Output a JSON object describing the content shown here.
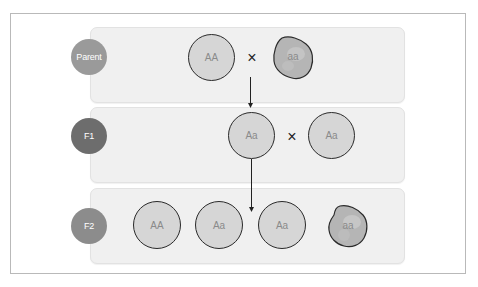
{
  "diagram": {
    "type": "genetic-cross",
    "colors": {
      "frame_border": "#b9b9b9",
      "panel_bg": "#f0f0f0",
      "genotype_fill": "#d6d6d6",
      "recessive_fill": "#b7b7b7",
      "parent_label": "#9a9a9a",
      "f1_label": "#6d6d6d",
      "f2_label": "#8c8c8c",
      "outline": "#2a2a2a"
    },
    "cross_symbol": "×",
    "rows": [
      {
        "label": "Parent",
        "individuals": [
          {
            "genotype": "AA",
            "shape": "circle"
          },
          {
            "genotype": "aa",
            "shape": "blob"
          }
        ]
      },
      {
        "label": "F1",
        "individuals": [
          {
            "genotype": "Aa",
            "shape": "circle"
          },
          {
            "genotype": "Aa",
            "shape": "circle"
          }
        ]
      },
      {
        "label": "F2",
        "individuals": [
          {
            "genotype": "AA",
            "shape": "circle"
          },
          {
            "genotype": "Aa",
            "shape": "circle"
          },
          {
            "genotype": "Aa",
            "shape": "circle"
          },
          {
            "genotype": "aa",
            "shape": "blob"
          }
        ]
      }
    ]
  }
}
